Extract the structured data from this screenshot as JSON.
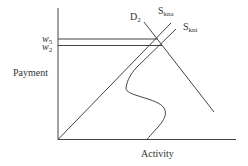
{
  "diagram": {
    "type": "supply-demand graph",
    "y_axis_label": "Payment",
    "x_axis_label": "Activity",
    "price_levels": [
      {
        "label_main": "w",
        "label_sub": "5"
      },
      {
        "label_main": "w",
        "label_sub": "2"
      }
    ],
    "curves": [
      {
        "label_main": "D",
        "label_sub": "2",
        "kind": "demand"
      },
      {
        "label_main": "S",
        "label_sub": "kna",
        "kind": "supply"
      },
      {
        "label_main": "S",
        "label_sub": "kni",
        "kind": "supply-backward-bending"
      }
    ]
  }
}
